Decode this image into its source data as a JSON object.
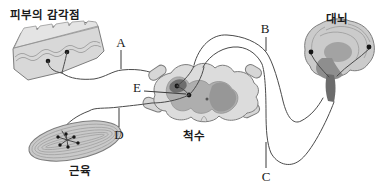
{
  "figure": {
    "title_context": "reflex-pathway-diagram",
    "skin": {
      "label": "피부의 감각점"
    },
    "brain": {
      "label": "대뇌"
    },
    "spinal_cord": {
      "label": "척수"
    },
    "muscle": {
      "label": "근육"
    },
    "markers": {
      "a": "A",
      "b": "B",
      "c": "C",
      "d": "D",
      "e": "E"
    },
    "colors": {
      "line": "#4a4a4a",
      "skin_fill": "#d8d8d8",
      "skin_top_fill": "#e4e4e4",
      "cord_fill": "#dcdcdc",
      "root_fill": "#d6d6d6",
      "gray_matter": "#aeaeae",
      "gray_matter_dark": "#979797",
      "dorsal_blob": "#6e6e6e",
      "brain_fill": "#cbcbcb",
      "brain_inner": "#a3a3a3",
      "brain_dark": "#8e8e8e",
      "brain_stem": "#6c6c6c",
      "muscle_fill": "#c9c9c9",
      "text": "#1a1a1a"
    }
  }
}
